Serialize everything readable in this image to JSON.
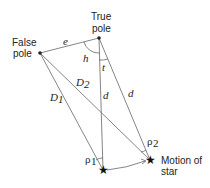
{
  "diagram": {
    "labels": {
      "true_pole_1": "True",
      "true_pole_2": "pole",
      "false_pole_1": "False",
      "false_pole_2": "pole",
      "motion_1": "Motion of",
      "motion_2": "star",
      "e": "e",
      "h": "h",
      "t": "t",
      "D1": "D",
      "D1_sub": "1",
      "D2": "D",
      "D2_sub": "2",
      "d_left": "d",
      "d_right": "d",
      "rho1": "ρ",
      "rho1_sub": "1",
      "rho2": "ρ",
      "rho2_sub": "2"
    },
    "colors": {
      "line": "#555555",
      "text": "#222222"
    }
  }
}
